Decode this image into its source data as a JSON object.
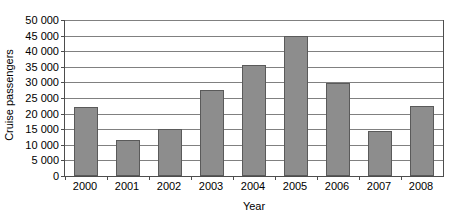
{
  "chart_data": {
    "type": "bar",
    "title": "",
    "xlabel": "Year",
    "ylabel": "Cruise passengers",
    "categories": [
      "2000",
      "2001",
      "2002",
      "2003",
      "2004",
      "2005",
      "2006",
      "2007",
      "2008"
    ],
    "values": [
      22000,
      11500,
      15200,
      27500,
      35500,
      45000,
      29700,
      14500,
      22300
    ],
    "ylim": [
      0,
      50000
    ],
    "y_ticks": [
      0,
      5000,
      10000,
      15000,
      20000,
      25000,
      30000,
      35000,
      40000,
      45000,
      50000
    ],
    "y_tick_labels": [
      "0",
      "5 000",
      "10 000",
      "15 000",
      "20 000",
      "25 000",
      "30 000",
      "35 000",
      "40 000",
      "45 000",
      "50 000"
    ],
    "grid": true,
    "legend": false,
    "legend_position": "none",
    "bar_color": "#8d8d8d",
    "bar_border_color": "#5a5a5a",
    "gridline_color": "#808080",
    "axis_color": "#4d4d4d"
  }
}
